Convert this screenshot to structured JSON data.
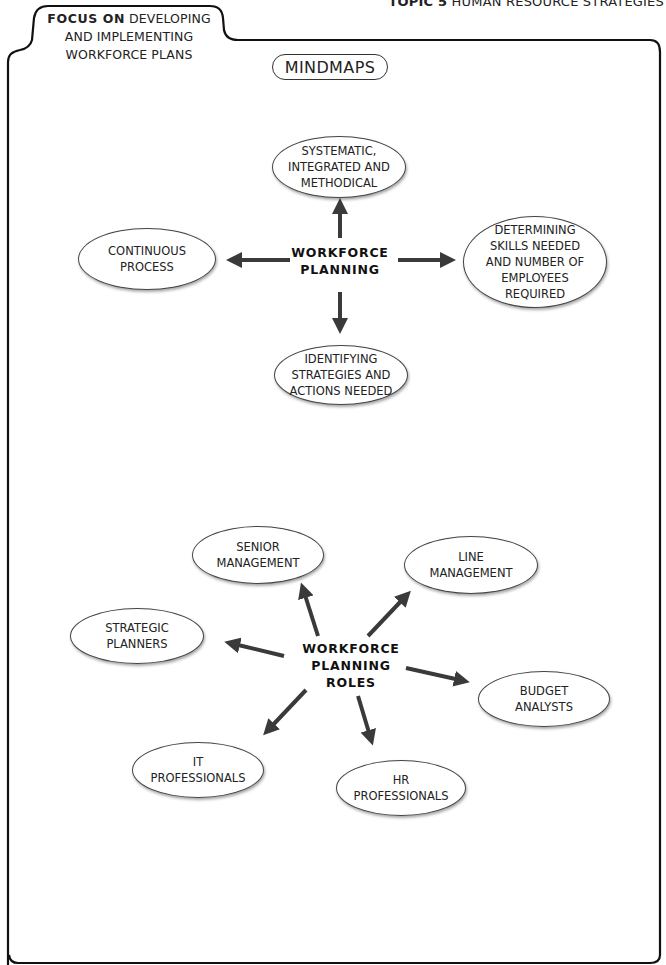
{
  "header": {
    "topic_bold": "TOPIC 5",
    "topic_text": "HUMAN RESOURCE STRATEGIES",
    "focus_bold": "FOCUS ON",
    "focus_text": "DEVELOPING AND IMPLEMENTING WORKFORCE PLANS"
  },
  "section_label": "MINDMAPS",
  "mindmap_1": {
    "center": "WORKFORCE\nPLANNING",
    "nodes": [
      {
        "position": "top",
        "label": "SYSTEMATIC,\nINTEGRATED AND\nMETHODICAL"
      },
      {
        "position": "left",
        "label": "CONTINUOUS\nPROCESS"
      },
      {
        "position": "right",
        "label": "DETERMINING\nSKILLS NEEDED\nAND NUMBER OF\nEMPLOYEES\nREQUIRED"
      },
      {
        "position": "bottom",
        "label": "IDENTIFYING\nSTRATEGIES AND\nACTIONS NEEDED"
      }
    ]
  },
  "mindmap_2": {
    "center": "WORKFORCE\nPLANNING\nROLES",
    "nodes": [
      {
        "position": "top-left",
        "label": "SENIOR\nMANAGEMENT"
      },
      {
        "position": "top-right",
        "label": "LINE\nMANAGEMENT"
      },
      {
        "position": "left",
        "label": "STRATEGIC\nPLANNERS"
      },
      {
        "position": "right",
        "label": "BUDGET\nANALYSTS"
      },
      {
        "position": "bottom-left",
        "label": "IT\nPROFESSIONALS"
      },
      {
        "position": "bottom",
        "label": "HR\nPROFESSIONALS"
      }
    ]
  },
  "colors": {
    "arrow": "#3a3a3a",
    "frame": "#111111",
    "text": "#222222"
  }
}
